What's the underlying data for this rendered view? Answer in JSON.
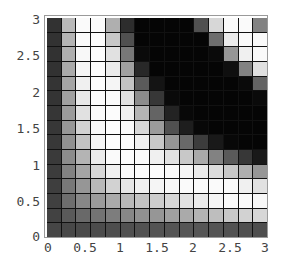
{
  "chart_data": {
    "type": "heatmap",
    "title": "",
    "xlabel": "",
    "ylabel": "",
    "xlim": [
      0,
      3
    ],
    "ylim": [
      0,
      3
    ],
    "grid": true,
    "colormap": "grayscale (0 = black, 255 = white)",
    "x_ticks": [
      "0",
      "0.5",
      "1",
      "1.5",
      "2",
      "2.5",
      "3"
    ],
    "y_ticks": [
      "0",
      "0.5",
      "1",
      "1.5",
      "2",
      "2.5",
      "3"
    ],
    "n_cols": 15,
    "n_rows": 15,
    "row_order": "top-to-bottom (first row is y≈3)",
    "values": [
      [
        50,
        185,
        250,
        250,
        175,
        45,
        5,
        5,
        5,
        5,
        80,
        215,
        250,
        250,
        130
      ],
      [
        50,
        180,
        250,
        252,
        200,
        80,
        5,
        5,
        5,
        5,
        5,
        110,
        235,
        250,
        250
      ],
      [
        50,
        175,
        248,
        252,
        225,
        120,
        10,
        5,
        5,
        5,
        5,
        10,
        150,
        240,
        250
      ],
      [
        50,
        170,
        245,
        252,
        235,
        160,
        40,
        5,
        5,
        5,
        5,
        5,
        15,
        130,
        225
      ],
      [
        52,
        165,
        240,
        252,
        245,
        195,
        90,
        20,
        5,
        5,
        5,
        5,
        5,
        10,
        100
      ],
      [
        52,
        160,
        232,
        252,
        250,
        225,
        140,
        55,
        10,
        5,
        5,
        5,
        5,
        5,
        10
      ],
      [
        54,
        155,
        225,
        250,
        252,
        240,
        180,
        100,
        35,
        8,
        5,
        5,
        5,
        5,
        5
      ],
      [
        55,
        150,
        210,
        248,
        252,
        250,
        215,
        155,
        80,
        30,
        8,
        5,
        5,
        5,
        5
      ],
      [
        56,
        145,
        195,
        245,
        252,
        252,
        240,
        200,
        150,
        105,
        60,
        25,
        8,
        5,
        5
      ],
      [
        58,
        140,
        180,
        235,
        250,
        252,
        250,
        240,
        225,
        200,
        170,
        130,
        90,
        55,
        25
      ],
      [
        60,
        130,
        165,
        215,
        240,
        250,
        252,
        252,
        250,
        245,
        235,
        220,
        200,
        175,
        150
      ],
      [
        62,
        120,
        150,
        185,
        210,
        230,
        240,
        245,
        248,
        250,
        250,
        250,
        250,
        240,
        225
      ],
      [
        64,
        110,
        135,
        155,
        170,
        185,
        195,
        205,
        215,
        225,
        235,
        245,
        250,
        250,
        248
      ],
      [
        66,
        90,
        105,
        115,
        125,
        135,
        145,
        150,
        160,
        170,
        180,
        190,
        200,
        210,
        215
      ],
      [
        70,
        72,
        74,
        76,
        78,
        80,
        82,
        84,
        85,
        86,
        86,
        84,
        82,
        80,
        78
      ]
    ]
  }
}
